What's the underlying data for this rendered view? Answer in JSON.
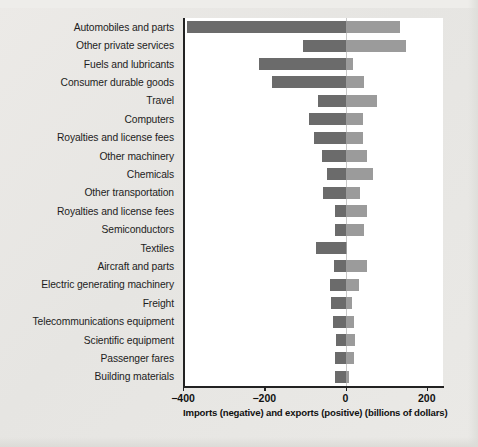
{
  "chart_data": {
    "type": "bar",
    "orientation": "horizontal",
    "title": "",
    "subtitle": "",
    "xlabel": "Imports (negative) and exports (positive) (billions of dollars)",
    "ylabel": "",
    "xlim": [
      -400,
      240
    ],
    "xticks": [
      -400,
      -200,
      0,
      200
    ],
    "xticklabels": [
      "−400",
      "−200",
      "0",
      "200"
    ],
    "grid": false,
    "legend": null,
    "categories": [
      "Automobiles and parts",
      "Other private services",
      "Fuels and lubricants",
      "Consumer durable goods",
      "Travel",
      "Computers",
      "Royalties and license fees",
      "Other machinery",
      "Chemicals",
      "Other transportation",
      "Royalties and license fees",
      "Semiconductors",
      "Textiles",
      "Aircraft and parts",
      "Electric generating machinery",
      "Freight",
      "Telecommunications equipment",
      "Scientific equipment",
      "Passenger fares",
      "Building materials"
    ],
    "series": [
      {
        "name": "Imports (negative)",
        "color": "#6b6b6b",
        "values": [
          -390,
          -105,
          -212,
          -182,
          -68,
          -90,
          -78,
          -58,
          -45,
          -55,
          -25,
          -27,
          -72,
          -28,
          -38,
          -35,
          -30,
          -23,
          -25,
          -27
        ]
      },
      {
        "name": "Exports (positive)",
        "color": "#9b9b9b",
        "values": [
          133,
          148,
          18,
          46,
          78,
          42,
          42,
          52,
          68,
          36,
          52,
          46,
          2,
          54,
          32,
          15,
          22,
          23,
          20,
          8
        ]
      }
    ]
  },
  "axis": {
    "x_title": "Imports (negative) and exports (positive) (billions of dollars)",
    "ticks": [
      {
        "value": -400,
        "label": "−400"
      },
      {
        "value": -200,
        "label": "−200"
      },
      {
        "value": 0,
        "label": "0"
      },
      {
        "value": 200,
        "label": "200"
      }
    ]
  },
  "colors": {
    "imports": "#6b6b6b",
    "exports": "#9b9b9b",
    "axis": "#222222",
    "zero_line": "#c8c8c8",
    "plot_background": "#ffffff",
    "page_background": "#e9e9e7"
  }
}
